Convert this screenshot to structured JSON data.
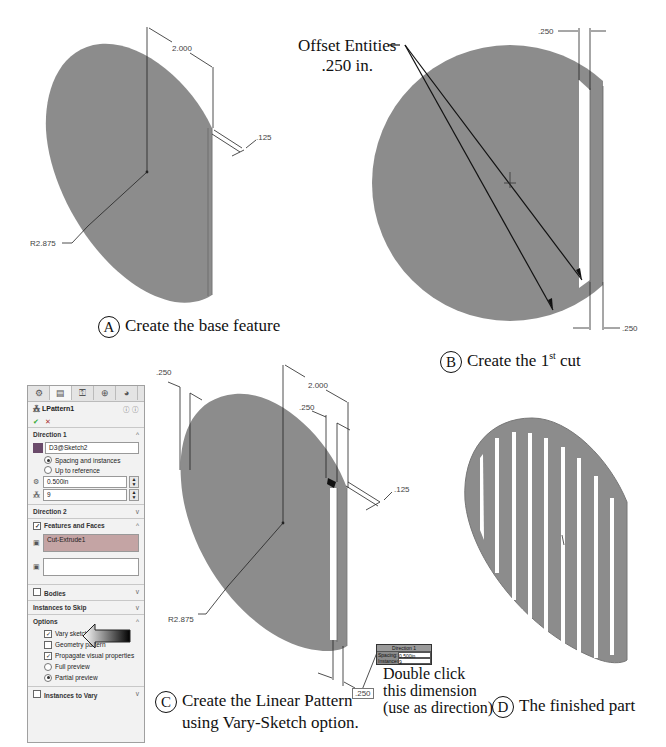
{
  "figure_a": {
    "label": "A",
    "caption": "Create the base feature",
    "dims": {
      "width": "2.000",
      "thickness": ".125",
      "radius": "R2.875"
    }
  },
  "figure_b": {
    "label": "B",
    "caption_pre": "Create the 1",
    "caption_sup": "st",
    "caption_post": " cut",
    "callout_line1": "Offset Entities",
    "callout_line2": ".250 in.",
    "dims": {
      "top": ".250",
      "bottom": ".250"
    }
  },
  "figure_c": {
    "label": "C",
    "caption_line1": "Create the Linear Pattern",
    "caption_line2": "using Vary-Sketch option.",
    "dims": {
      "left": ".250",
      "width": "2.000",
      "slot": ".250",
      "thickness": ".125",
      "radius": "R2.875",
      "bottom": ".250"
    },
    "note_line1": "Double click",
    "note_line2": "this dimension",
    "note_line3": "(use as direction)",
    "popup": {
      "title": "Direction 1",
      "spacing_label": "Spacing:",
      "spacing_value": "0.500in",
      "instances_label": "Instances:",
      "instances_value": "9"
    }
  },
  "figure_d": {
    "label": "D",
    "caption": "The finished part"
  },
  "property_manager": {
    "title": "LPattern1",
    "ok": "✔",
    "cancel": "✕",
    "help": "?",
    "direction1": {
      "label": "Direction 1",
      "reference": "D3@Sketch2",
      "opt_spacing": "Spacing and instances",
      "opt_reference": "Up to reference",
      "spacing": "0.500in",
      "instances": "9"
    },
    "direction2": {
      "label": "Direction 2"
    },
    "features": {
      "label": "Features and Faces",
      "item": "Cut-Extrude1"
    },
    "bodies": {
      "label": "Bodies"
    },
    "skip": {
      "label": "Instances to Skip"
    },
    "options": {
      "label": "Options",
      "vary_sketch": "Vary sketch",
      "geometry_pattern": "Geometry pattern",
      "propagate": "Propagate visual properties",
      "full_preview": "Full preview",
      "partial_preview": "Partial preview"
    },
    "vary": {
      "label": "Instances to Vary"
    }
  },
  "colors": {
    "part": "#8c8c8c",
    "part_dark": "#7a7a7a",
    "line": "#222222"
  }
}
